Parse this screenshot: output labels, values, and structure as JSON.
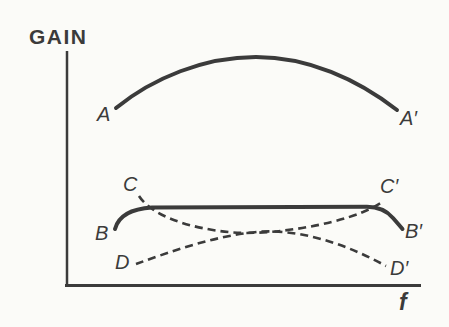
{
  "figure": {
    "type": "qualitative-line-graph",
    "background_color": "#fbfbf8",
    "ink_color": "#3b3b3b",
    "dash_pattern": "8 5",
    "axes": {
      "y_axis": {
        "label": "GAIN",
        "x": 67,
        "y1": 51,
        "y2": 286,
        "width": 2.5
      },
      "x_axis": {
        "label": "f",
        "y": 285.5,
        "x1": 65,
        "x2": 421,
        "width": 3
      }
    },
    "curves": [
      {
        "id": "curve-A",
        "start_label": "A",
        "end_label": "A′",
        "style": "solid",
        "width": 4,
        "path": "M 116 108 C 153 78 204 57 256 57 C 308 57 357 79 397 110"
      },
      {
        "id": "curve-B",
        "start_label": "B",
        "end_label": "B′",
        "style": "solid",
        "width": 4,
        "path": "M 115 229 C 118 218 128 209 152 207.6 L 367 206.8 C 379 206.8 387 211 393 218 C 396.5 222 400 226 402.5 229"
      },
      {
        "id": "curve-C",
        "start_label": "C",
        "end_label": "C′",
        "style": "dashed",
        "width": 2.6,
        "path": "M 139 196 C 151 215 188 228.5 233 232.5 C 268 235 328 226.5 363 212 C 371 208.5 378 205 384 201"
      },
      {
        "id": "curve-D",
        "start_label": "D",
        "end_label": "D′",
        "style": "dashed",
        "width": 2.6,
        "path": "M 136 264 C 172 251 216 235.5 258 231.8 C 299 228.8 344 243 386 266"
      }
    ],
    "labels": [
      {
        "text": "GAIN",
        "left": 29,
        "top": 26,
        "size": 21,
        "italic": false,
        "weight": 600,
        "letter_spacing": 1.5
      },
      {
        "text": "f",
        "left": 399,
        "top": 291,
        "size": 23,
        "italic": true,
        "weight": 600,
        "letter_spacing": 0
      },
      {
        "text": "A",
        "left": 97,
        "top": 104,
        "size": 20,
        "italic": true,
        "weight": 500,
        "letter_spacing": 0
      },
      {
        "text": "A′",
        "left": 400,
        "top": 108,
        "size": 20,
        "italic": true,
        "weight": 500,
        "letter_spacing": 0
      },
      {
        "text": "B",
        "left": 95,
        "top": 223,
        "size": 20,
        "italic": true,
        "weight": 500,
        "letter_spacing": 0
      },
      {
        "text": "B′",
        "left": 405,
        "top": 221,
        "size": 20,
        "italic": true,
        "weight": 500,
        "letter_spacing": 0
      },
      {
        "text": "C",
        "left": 123,
        "top": 174,
        "size": 20,
        "italic": true,
        "weight": 500,
        "letter_spacing": 0
      },
      {
        "text": "C′",
        "left": 380,
        "top": 176,
        "size": 20,
        "italic": true,
        "weight": 500,
        "letter_spacing": 0
      },
      {
        "text": "D",
        "left": 115,
        "top": 252,
        "size": 20,
        "italic": true,
        "weight": 500,
        "letter_spacing": 0
      },
      {
        "text": "D′",
        "left": 390,
        "top": 258,
        "size": 20,
        "italic": true,
        "weight": 500,
        "letter_spacing": 0
      }
    ]
  }
}
